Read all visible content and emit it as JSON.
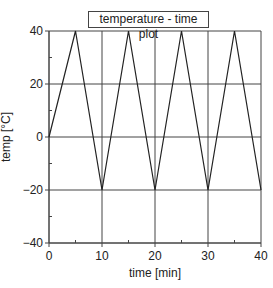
{
  "chart_data": {
    "type": "line",
    "title": "temperature - time plot",
    "xlabel": "time [min]",
    "ylabel": "temp [°C]",
    "xlim": [
      0,
      40
    ],
    "ylim": [
      -40,
      40
    ],
    "x_ticks": [
      0,
      10,
      20,
      30,
      40
    ],
    "y_ticks": [
      -40,
      -20,
      0,
      20,
      40
    ],
    "x_minor_ticks": [
      5,
      15,
      25,
      35
    ],
    "y_minor_ticks": [
      -30,
      -10,
      10,
      30
    ],
    "grid": true,
    "legend": null,
    "series": [
      {
        "name": "temperature",
        "x": [
          0,
          5,
          10,
          15,
          20,
          25,
          30,
          35,
          40
        ],
        "y": [
          0,
          40,
          -20,
          40,
          -20,
          40,
          -20,
          40,
          -20
        ]
      }
    ],
    "colors": {
      "line": "#222222",
      "grid": "#444444",
      "axis": "#444444"
    }
  }
}
